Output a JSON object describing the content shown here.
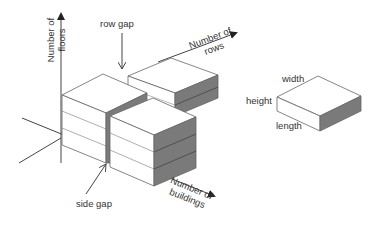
{
  "diagram": {
    "type": "isometric building layout diagram",
    "axes": {
      "vertical": {
        "label_line1": "Number of",
        "label_line2": "floors"
      },
      "rows": {
        "label_line1": "Number of",
        "label_line2": "rows"
      },
      "buildings": {
        "label_line1": "Number of",
        "label_line2": "buildings"
      }
    },
    "annotations": {
      "row_gap": "row gap",
      "side_gap": "side gap"
    },
    "legend_block": {
      "width_label": "width",
      "height_label": "height",
      "length_label": "length"
    },
    "colors": {
      "line": "#555555",
      "face_light": "#ffffff",
      "face_dark": "#7a7a7a",
      "text": "#333333"
    }
  }
}
